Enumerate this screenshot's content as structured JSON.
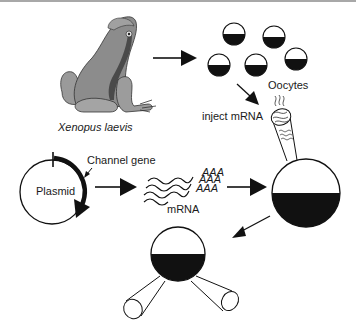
{
  "figure": {
    "labels": {
      "species": "Xenopus laevis",
      "oocytes": "Oocytes",
      "inject": "inject mRNA",
      "channel_gene": "Channel gene",
      "plasmid": "Plasmid",
      "mrna": "mRNA",
      "polyA": [
        "AAA",
        "AAA",
        "AAA"
      ]
    },
    "colors": {
      "ink": "#111111",
      "frog_fill": "#8a8a8a",
      "frog_dark": "#555555",
      "frog_light": "#b4b4b4",
      "top_rule": "#a8a8a8"
    },
    "steps": [
      "frog",
      "oocytes",
      "inject mRNA",
      "plasmid with channel gene",
      "mRNA",
      "injected oocyte",
      "two-electrode recording"
    ]
  }
}
